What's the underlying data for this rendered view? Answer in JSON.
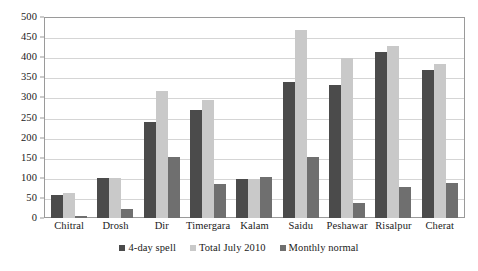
{
  "chart_data": {
    "type": "bar",
    "title": "",
    "subtitle": "",
    "xlabel": "",
    "ylabel": "",
    "ylim": [
      0,
      500
    ],
    "ytick_step": 50,
    "yticks": [
      0,
      50,
      100,
      150,
      200,
      250,
      300,
      350,
      400,
      450,
      500
    ],
    "grid": true,
    "grid_axis": "y",
    "legend_position": "bottom-center",
    "categories": [
      "Chitral",
      "Drosh",
      "Dir",
      "Timergara",
      "Kalam",
      "Saidu",
      "Peshawar",
      "Risalpur",
      "Cherat"
    ],
    "series": [
      {
        "name": "4-day spell",
        "color": "#4b4b4b",
        "values": [
          58,
          99,
          240,
          268,
          97,
          338,
          332,
          412,
          368
        ]
      },
      {
        "name": "Total July 2010",
        "color": "#c9c9c9",
        "values": [
          62,
          99,
          315,
          293,
          98,
          468,
          398,
          428,
          382
        ]
      },
      {
        "name": "Monthly normal",
        "color": "#6f6f6f",
        "values": [
          4,
          22,
          153,
          85,
          103,
          152,
          38,
          78,
          87
        ]
      }
    ]
  }
}
